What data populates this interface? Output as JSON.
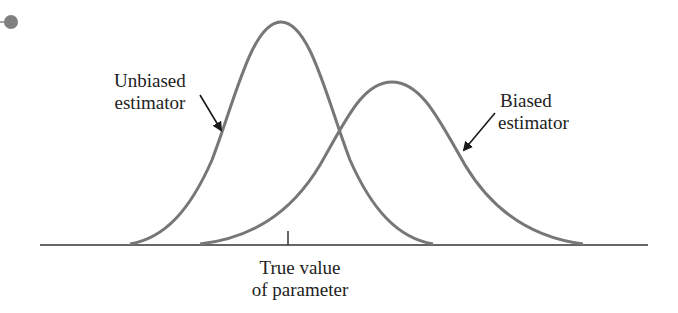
{
  "diagram": {
    "type": "two overlapping bell curves on a baseline",
    "labels": {
      "unbiased_line1": "Unbiased",
      "unbiased_line2": "estimator",
      "biased_line1": "Biased",
      "biased_line2": "estimator",
      "axis_line1": "True value",
      "axis_line2": "of parameter"
    },
    "curves": [
      {
        "name": "Unbiased estimator",
        "center_x": 281,
        "peak_y": 22,
        "start_x": 130,
        "end_x": 433
      },
      {
        "name": "Biased estimator",
        "center_x": 392,
        "peak_y": 82,
        "start_x": 200,
        "end_x": 583
      }
    ],
    "baseline": {
      "y": 245,
      "x_start": 40,
      "x_end": 648
    },
    "true_value_tick_x": 288,
    "colors": {
      "curve": "#777777",
      "axis": "#333333",
      "arrow": "#1a1a1a",
      "bullet": "#808080"
    }
  }
}
